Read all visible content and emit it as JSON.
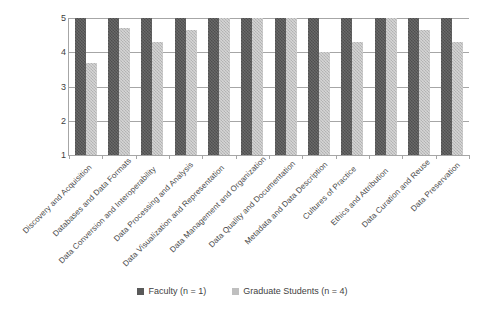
{
  "chart_data": {
    "type": "bar",
    "title": "",
    "subtitle": "",
    "xlabel": "",
    "ylabel": "",
    "ylim": [
      1,
      5
    ],
    "yticks": [
      1,
      2,
      3,
      4,
      5
    ],
    "grid": true,
    "legend_position": "bottom",
    "orientation": "vertical",
    "categories": [
      "Discovery and Acquisition",
      "Databases and Data Formats",
      "Data Conversion and Interoperability",
      "Data Processing and Analysis",
      "Data Visualization and Representation",
      "Data Management and Organization",
      "Data Quality and Documentation",
      "Metadata and Data Description",
      "Cultures of Practice",
      "Ethics and Attribution",
      "Data Curation and Reuse",
      "Data Preservation"
    ],
    "series": [
      {
        "name": "Faculty (n = 1)",
        "color": "#595959",
        "values": [
          5,
          5,
          5,
          5,
          5,
          5,
          5,
          5,
          5,
          5,
          5,
          5
        ]
      },
      {
        "name": "Graduate Students (n = 4)",
        "color": "#bfbfbf",
        "values": [
          3.7,
          4.7,
          4.3,
          4.65,
          5,
          5,
          5,
          4,
          4.3,
          5,
          4.65,
          4.3
        ]
      }
    ]
  },
  "axis": {
    "y_tick_labels": [
      "5",
      "4",
      "3",
      "2",
      "1"
    ]
  },
  "legend": {
    "items": [
      {
        "label": "Faculty (n = 1)",
        "swatch_class": "series-faculty"
      },
      {
        "label": "Graduate Students (n = 4)",
        "swatch_class": "series-grad"
      }
    ]
  }
}
